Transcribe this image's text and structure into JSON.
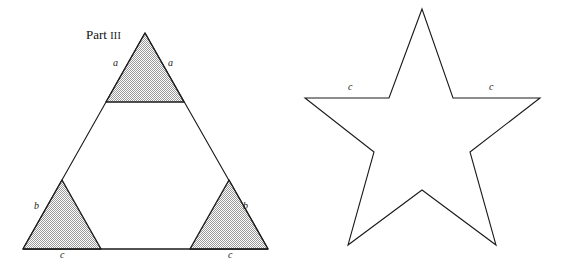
{
  "page": {
    "background_color": "#ffffff",
    "width": 568,
    "height": 264
  },
  "caption": {
    "part_word": "Part",
    "part_numeral": "III"
  },
  "figures": {
    "triangle_figure": {
      "name": "subdivided-triangle",
      "stroke_color": "#1a1a1a",
      "fill_color": "#c9c9c9",
      "outer_triangle": {
        "apex": [
          145,
          33
        ],
        "bottom_left": [
          23,
          249
        ],
        "bottom_right": [
          268,
          249
        ]
      },
      "shaded_triangles": [
        {
          "id": "top",
          "points": [
            [
              145,
              33
            ],
            [
              106,
              102
            ],
            [
              184,
              102
            ]
          ]
        },
        {
          "id": "bottom-left",
          "points": [
            [
              62,
              180
            ],
            [
              23,
              249
            ],
            [
              101,
              249
            ]
          ]
        },
        {
          "id": "bottom-right",
          "points": [
            [
              229,
              180
            ],
            [
              190,
              249
            ],
            [
              268,
              249
            ]
          ]
        }
      ],
      "labels": [
        {
          "id": "a-left",
          "text": "a",
          "x": 113,
          "y": 63
        },
        {
          "id": "a-right",
          "text": "a",
          "x": 168,
          "y": 63
        },
        {
          "id": "b-left",
          "text": "b",
          "x": 34,
          "y": 206
        },
        {
          "id": "b-right",
          "text": "b",
          "x": 243,
          "y": 206
        },
        {
          "id": "c-left",
          "text": "c",
          "x": 60,
          "y": 253
        },
        {
          "id": "c-right",
          "text": "c",
          "x": 228,
          "y": 253
        }
      ]
    },
    "star_figure": {
      "name": "five-pointed-star",
      "stroke_color": "#1a1a1a",
      "fill_color": "none",
      "points": [
        [
          422,
          9
        ],
        [
          453,
          98
        ],
        [
          540,
          98
        ],
        [
          470,
          152
        ],
        [
          496,
          245
        ],
        [
          422,
          190
        ],
        [
          348,
          245
        ],
        [
          374,
          152
        ],
        [
          305,
          98
        ],
        [
          389,
          98
        ]
      ],
      "labels": [
        {
          "id": "c-left",
          "text": "c",
          "x": 348,
          "y": 87
        },
        {
          "id": "c-right",
          "text": "c",
          "x": 489,
          "y": 87
        }
      ]
    }
  }
}
